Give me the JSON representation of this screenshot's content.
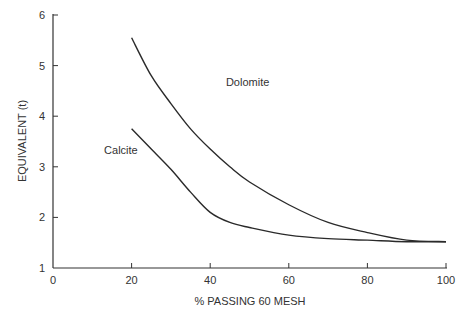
{
  "chart_data": {
    "type": "line",
    "title": "",
    "xlabel": "% PASSING 60 MESH",
    "ylabel": "EQUIVALENT (t)",
    "xlim": [
      0,
      100
    ],
    "ylim": [
      1,
      6
    ],
    "xticks": [
      0,
      20,
      40,
      60,
      80,
      100
    ],
    "yticks": [
      1,
      2,
      3,
      4,
      5,
      6
    ],
    "grid": false,
    "legend": "none (inline curve labels)",
    "series": [
      {
        "name": "Dolomite",
        "x": [
          20,
          25,
          30,
          35,
          40,
          45,
          50,
          60,
          70,
          80,
          90,
          100
        ],
        "values": [
          5.55,
          4.8,
          4.25,
          3.75,
          3.35,
          3.0,
          2.7,
          2.25,
          1.9,
          1.7,
          1.55,
          1.52
        ]
      },
      {
        "name": "Calcite",
        "x": [
          20,
          25,
          30,
          35,
          40,
          45,
          50,
          60,
          70,
          80,
          90,
          100
        ],
        "values": [
          3.75,
          3.35,
          2.95,
          2.5,
          2.1,
          1.9,
          1.8,
          1.65,
          1.58,
          1.55,
          1.52,
          1.52
        ]
      }
    ],
    "annotations": [
      {
        "text": "Dolomite",
        "x": 44,
        "y": 4.6
      },
      {
        "text": "Calcite",
        "x": 13,
        "y": 3.25
      }
    ]
  },
  "colors": {
    "axis": "#333333",
    "line": "#2a2a2a",
    "text": "#333333"
  }
}
